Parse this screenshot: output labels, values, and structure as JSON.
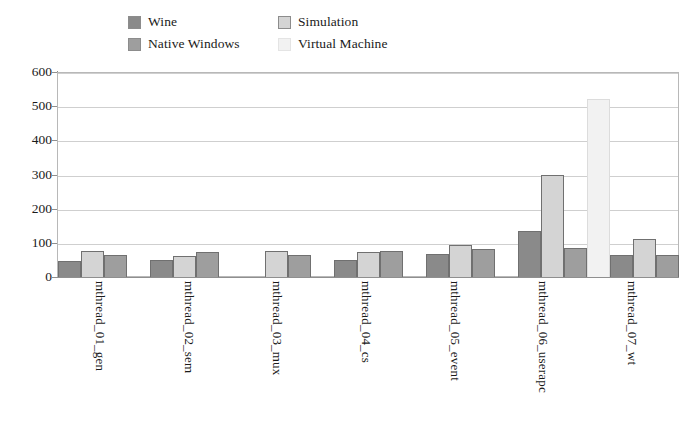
{
  "chart_data": {
    "type": "bar",
    "title": "",
    "subtitle": "",
    "xlabel": "",
    "ylabel": "",
    "ylim": [
      0,
      600
    ],
    "ytick_step": 100,
    "yticks": [
      600,
      500,
      400,
      300,
      200,
      100,
      0
    ],
    "grid": true,
    "grid_axis": "y",
    "legend_position": "top",
    "legend_columns": 2,
    "categories": [
      "mthread_01_gen",
      "mthread_02_sem",
      "mthread_03_mux",
      "mthread_04_cs",
      "mthread_05_event",
      "mthread_06_userapc",
      "mthread_07_wt"
    ],
    "series": [
      {
        "name": "Wine",
        "color": "#8a8a8a",
        "values": [
          46,
          50,
          0,
          50,
          68,
          135,
          63
        ]
      },
      {
        "name": "Simulation",
        "color": "#d4d4d4",
        "values": [
          76,
          62,
          75,
          72,
          93,
          300,
          110
        ]
      },
      {
        "name": "Native Windows",
        "color": "#9e9e9e",
        "values": [
          63,
          72,
          63,
          75,
          83,
          85,
          63
        ]
      },
      {
        "name": "Virtual Machine",
        "color": "#f2f2f2",
        "values": [
          0,
          0,
          0,
          0,
          0,
          520,
          0
        ]
      }
    ]
  },
  "legend": {
    "entries": [
      {
        "label": "Wine",
        "color": "#8a8a8a"
      },
      {
        "label": "Simulation",
        "color": "#d4d4d4"
      },
      {
        "label": "Native Windows",
        "color": "#9e9e9e"
      },
      {
        "label": "Virtual Machine",
        "color": "#f2f2f2"
      }
    ]
  },
  "axis": {
    "y_tick_labels": [
      "600",
      "500",
      "400",
      "300",
      "200",
      "100",
      "0"
    ]
  },
  "colors": {
    "gridline": "#cfcfcf",
    "axis": "#8f8f8f",
    "plot_border": "#b8b8b8",
    "background": "#ffffff",
    "text": "#1a1a1a"
  }
}
